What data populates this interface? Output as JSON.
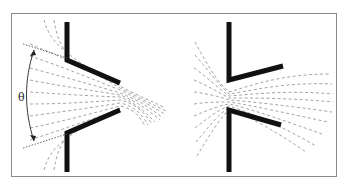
{
  "figure": {
    "panels": [
      {
        "id": "left",
        "description": "converging nozzle with spray cone diverging to the left; angle labeled"
      },
      {
        "id": "right",
        "description": "diverging nozzle with spray expanding to the right"
      }
    ],
    "labels": {
      "theta": "θ"
    },
    "colors": {
      "wall": "#111111",
      "flow": "#9a9a9a",
      "frame": "#8a8a8a",
      "dotted": "#555555"
    }
  }
}
